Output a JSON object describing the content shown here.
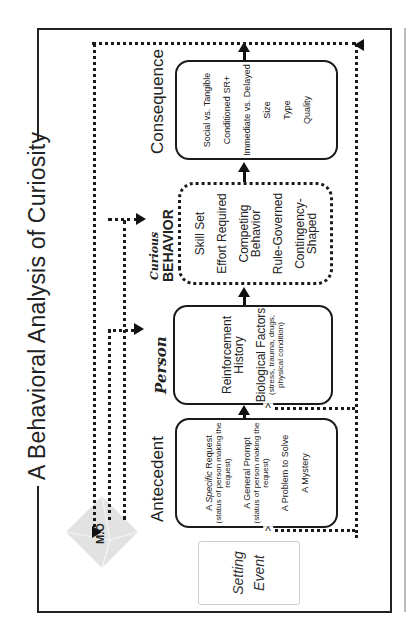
{
  "title": "A Behavioral Analysis of Curiosity",
  "nodes": {
    "setting_event": {
      "line1": "Setting",
      "line2": "Event"
    },
    "mo": {
      "label": "M.O"
    },
    "antecedent": {
      "heading": "Antecedent",
      "items": [
        {
          "main": "A Specific Request",
          "emphasis": "Specific",
          "sub": "(status of person making the request)"
        },
        {
          "main": "A General Prompt",
          "sub": "(status of person making the request)"
        },
        {
          "main": "A Problem to Solve"
        },
        {
          "main": "A Mystery"
        }
      ]
    },
    "person": {
      "heading": "Person",
      "items": [
        {
          "main": "Reinforcement History"
        },
        {
          "main": "Biological Factors",
          "sub": "(stress, trauma, drugs, physical condition)"
        }
      ]
    },
    "behavior": {
      "heading_top": "Curious",
      "heading_bottom": "BEHAVIOR",
      "items": [
        {
          "main": "Skill Set"
        },
        {
          "main": "Effort Required"
        },
        {
          "main": "Competing Behavior"
        },
        {
          "main": "Rule-Governed"
        },
        {
          "main": "Contingency-Shaped"
        }
      ]
    },
    "consequence": {
      "heading": "Consequence",
      "items": [
        {
          "main": "Social vs. Tangible"
        },
        {
          "main": "Conditioned SR+"
        },
        {
          "main": "Immediate vs. Delayed"
        },
        {
          "main": "Size"
        },
        {
          "main": "Type"
        },
        {
          "main": "Quality"
        }
      ]
    }
  },
  "flow": [
    "Setting Event",
    "Antecedent",
    "Person",
    "Curious BEHAVIOR",
    "Consequence"
  ],
  "orientation": "rotated 90deg counter-clockwise",
  "colors": {
    "line": "#1a1a1a",
    "mo_fill": "#e0e0e0",
    "setting_border": "#cccccc"
  }
}
